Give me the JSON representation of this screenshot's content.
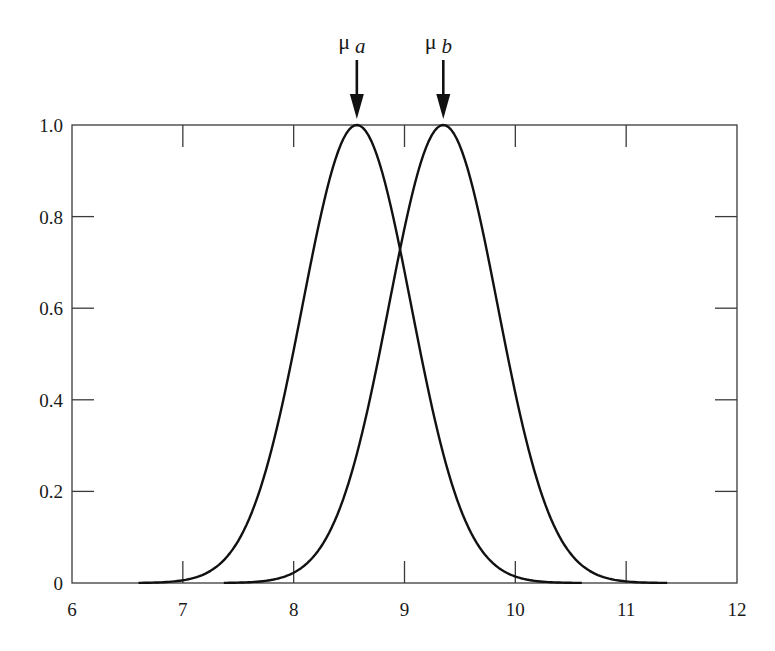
{
  "chart_data": {
    "type": "line",
    "title": "",
    "xlabel": "",
    "ylabel": "",
    "xlim": [
      6,
      12
    ],
    "ylim": [
      0,
      1.0
    ],
    "grid": false,
    "legend": "none",
    "x_ticks": [
      6,
      7,
      8,
      9,
      10,
      11,
      12
    ],
    "x_tick_labels": [
      "6",
      "7",
      "8",
      "9",
      "10",
      "11",
      "12"
    ],
    "y_ticks": [
      0,
      0.2,
      0.4,
      0.6,
      0.8,
      1.0
    ],
    "y_tick_labels": [
      "0",
      "0.2",
      "0.4",
      "0.6",
      "0.8",
      "1.0"
    ],
    "series": [
      {
        "name": "a",
        "shape": "gaussian",
        "mean": 8.57,
        "sigma": 0.49,
        "peak": 1.0,
        "x_range": [
          6.6,
          10.6
        ],
        "points": [
          [
            6.6,
            0.0
          ],
          [
            7.0,
            0.006
          ],
          [
            7.3,
            0.035
          ],
          [
            7.6,
            0.14
          ],
          [
            7.8,
            0.29
          ],
          [
            8.0,
            0.51
          ],
          [
            8.2,
            0.75
          ],
          [
            8.4,
            0.94
          ],
          [
            8.57,
            1.0
          ],
          [
            8.75,
            0.93
          ],
          [
            8.96,
            0.73
          ],
          [
            9.2,
            0.44
          ],
          [
            9.4,
            0.24
          ],
          [
            9.6,
            0.11
          ],
          [
            9.8,
            0.04
          ],
          [
            10.0,
            0.014
          ],
          [
            10.3,
            0.002
          ],
          [
            10.6,
            0.0
          ]
        ]
      },
      {
        "name": "b",
        "shape": "gaussian",
        "mean": 9.35,
        "sigma": 0.49,
        "peak": 1.0,
        "x_range": [
          7.37,
          11.37
        ],
        "points": [
          [
            7.37,
            0.0
          ],
          [
            7.7,
            0.004
          ],
          [
            8.0,
            0.022
          ],
          [
            8.3,
            0.1
          ],
          [
            8.5,
            0.22
          ],
          [
            8.74,
            0.44
          ],
          [
            8.96,
            0.73
          ],
          [
            9.15,
            0.92
          ],
          [
            9.35,
            1.0
          ],
          [
            9.55,
            0.92
          ],
          [
            9.75,
            0.72
          ],
          [
            9.95,
            0.47
          ],
          [
            10.15,
            0.26
          ],
          [
            10.35,
            0.12
          ],
          [
            10.6,
            0.035
          ],
          [
            10.9,
            0.007
          ],
          [
            11.1,
            0.002
          ],
          [
            11.37,
            0.0
          ]
        ]
      }
    ],
    "annotations": [
      {
        "text": "μ",
        "subscript": "a",
        "x": 8.57,
        "y": 1.0,
        "type": "down-arrow"
      },
      {
        "text": "μ",
        "subscript": "b",
        "x": 9.35,
        "y": 1.0,
        "type": "down-arrow"
      }
    ]
  }
}
